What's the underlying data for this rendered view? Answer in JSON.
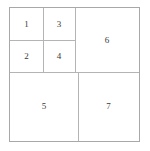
{
  "diagram": {
    "type": "rectangle-packing-partition",
    "frame": {
      "x": 9,
      "y": 7,
      "width": 131,
      "height": 135,
      "border_color": "#a8a8a8"
    },
    "divider_color": "#b4b4b4",
    "label_color": "#3a3a3a",
    "cells": [
      {
        "label": "1",
        "x": 0,
        "y": 0,
        "width": 33,
        "height": 32
      },
      {
        "label": "3",
        "x": 33,
        "y": 0,
        "width": 32,
        "height": 32
      },
      {
        "label": "2",
        "x": 0,
        "y": 32,
        "width": 33,
        "height": 32
      },
      {
        "label": "4",
        "x": 33,
        "y": 32,
        "width": 32,
        "height": 32
      },
      {
        "label": "6",
        "x": 65,
        "y": 0,
        "width": 64,
        "height": 64
      },
      {
        "label": "5",
        "x": 0,
        "y": 64,
        "width": 68,
        "height": 69
      },
      {
        "label": "7",
        "x": 68,
        "y": 64,
        "width": 61,
        "height": 69
      }
    ],
    "dividers": [
      {
        "orientation": "h",
        "x": 0,
        "y": 32,
        "length": 65
      },
      {
        "orientation": "h",
        "x": 0,
        "y": 64,
        "length": 129
      },
      {
        "orientation": "v",
        "x": 33,
        "y": 0,
        "length": 64
      },
      {
        "orientation": "v",
        "x": 65,
        "y": 0,
        "length": 64
      },
      {
        "orientation": "v",
        "x": 68,
        "y": 64,
        "length": 69
      }
    ]
  }
}
